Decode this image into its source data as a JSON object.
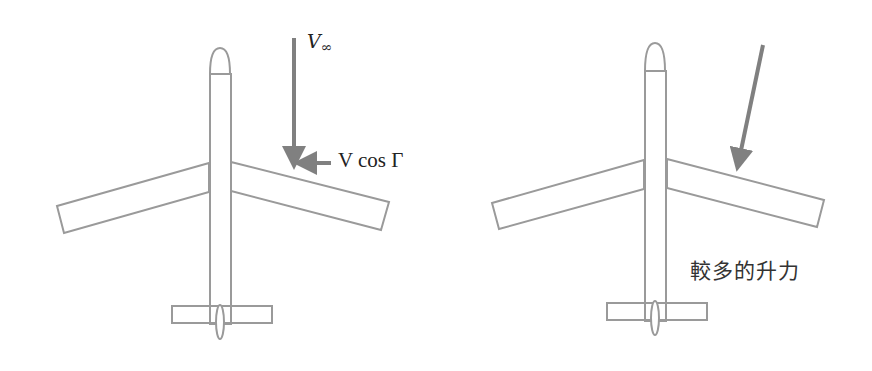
{
  "figure": {
    "colors": {
      "outline": "#9a9a9a",
      "arrow": "#808080",
      "text": "#222222",
      "background": "#ffffff"
    },
    "left_panel": {
      "freestream_label_main": "V",
      "freestream_label_sub": "∞",
      "component_label": "V  cos Γ",
      "arrows": [
        "freestream-down-arrow",
        "spanwise-component-arrow"
      ]
    },
    "right_panel": {
      "lift_label": "較多的升力",
      "arrows": [
        "oblique-freestream-arrow"
      ]
    }
  }
}
